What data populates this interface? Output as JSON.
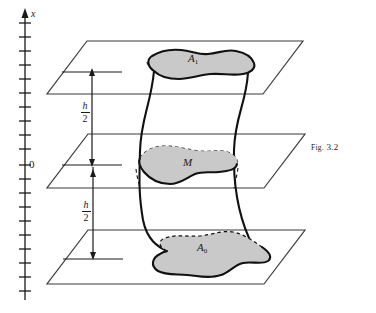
{
  "figure": {
    "caption_prefix": "Fig.",
    "caption_number": "3.2",
    "caption_full": "Fig. 3.2",
    "axis": {
      "label": "x",
      "origin_label": "0",
      "tick_count": 20,
      "direction": "up"
    },
    "dimensions": [
      {
        "id": "upper",
        "numerator": "h",
        "denominator": "2",
        "text": "h/2"
      },
      {
        "id": "lower",
        "numerator": "h",
        "denominator": "2",
        "text": "h/2"
      }
    ],
    "regions": [
      {
        "id": "top",
        "label": "A",
        "subscript": "1",
        "plane": "upper"
      },
      {
        "id": "middle",
        "label": "M",
        "subscript": "",
        "plane": "middle"
      },
      {
        "id": "bottom",
        "label": "A",
        "subscript": "0",
        "plane": "lower"
      }
    ],
    "colors": {
      "ink": "#1a1a1a",
      "plane_line": "#3a3a3a",
      "region_fill": "#c9c9c9",
      "region_stroke": "#111111",
      "background": "#ffffff"
    }
  }
}
